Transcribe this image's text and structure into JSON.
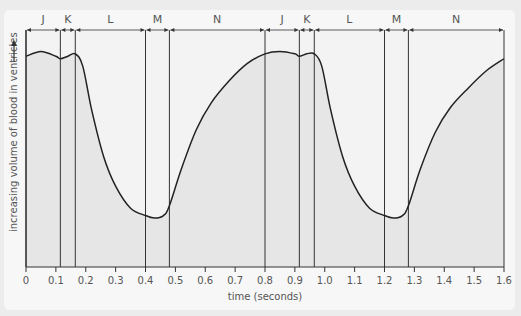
{
  "chart_data": {
    "type": "line",
    "title": "",
    "xlabel": "time (seconds)",
    "ylabel": "increasing volume of blood in ventricles",
    "xlim": [
      0,
      1.6
    ],
    "ylim": [
      0,
      100
    ],
    "x_ticks": [
      0,
      0.1,
      0.2,
      0.3,
      0.4,
      0.5,
      0.6,
      0.7,
      0.8,
      0.9,
      1.0,
      1.1,
      1.2,
      1.3,
      1.4,
      1.5,
      1.6
    ],
    "x_tick_labels": [
      "0",
      "0.1",
      "0.2",
      "0.3",
      "0.4",
      "0.5",
      "0.6",
      "0.7",
      "0.8",
      "0.9",
      "1.0",
      "1.1",
      "1.2",
      "1.3",
      "1.4",
      "1.5",
      "1.6"
    ],
    "phases": [
      {
        "label": "J",
        "start": 0.0,
        "end": 0.115
      },
      {
        "label": "K",
        "start": 0.115,
        "end": 0.165
      },
      {
        "label": "L",
        "start": 0.165,
        "end": 0.4
      },
      {
        "label": "M",
        "start": 0.4,
        "end": 0.48
      },
      {
        "label": "N",
        "start": 0.48,
        "end": 0.8
      },
      {
        "label": "J",
        "start": 0.8,
        "end": 0.915
      },
      {
        "label": "K",
        "start": 0.915,
        "end": 0.965
      },
      {
        "label": "L",
        "start": 0.965,
        "end": 1.2
      },
      {
        "label": "M",
        "start": 1.2,
        "end": 1.28
      },
      {
        "label": "N",
        "start": 1.28,
        "end": 1.6
      }
    ],
    "series": [
      {
        "name": "ventricular volume",
        "x": [
          0,
          0.05,
          0.1,
          0.115,
          0.14,
          0.165,
          0.19,
          0.22,
          0.26,
          0.3,
          0.35,
          0.4,
          0.43,
          0.46,
          0.48,
          0.52,
          0.57,
          0.62,
          0.68,
          0.74,
          0.8,
          0.85,
          0.9,
          0.915,
          0.94,
          0.965,
          0.99,
          1.02,
          1.06,
          1.1,
          1.15,
          1.2,
          1.23,
          1.26,
          1.28,
          1.32,
          1.37,
          1.42,
          1.48,
          1.54,
          1.6
        ],
        "values": [
          86,
          88,
          86,
          85,
          86,
          87,
          82,
          64,
          45,
          33,
          24,
          21,
          20,
          21,
          25,
          40,
          56,
          67,
          76,
          83,
          87,
          88,
          87,
          86,
          87,
          87,
          82,
          64,
          45,
          33,
          24,
          21,
          20,
          21,
          25,
          40,
          55,
          65,
          73,
          80,
          85
        ]
      }
    ],
    "grid": false,
    "legend": null,
    "fill_under_curve": true
  },
  "colors": {
    "background": "#ececec",
    "card": "#f7f7f7",
    "plot_area": "#f3f3f3",
    "fill": "#e6e6e6",
    "line": "#222222",
    "axis": "#333333",
    "text": "#555555"
  }
}
